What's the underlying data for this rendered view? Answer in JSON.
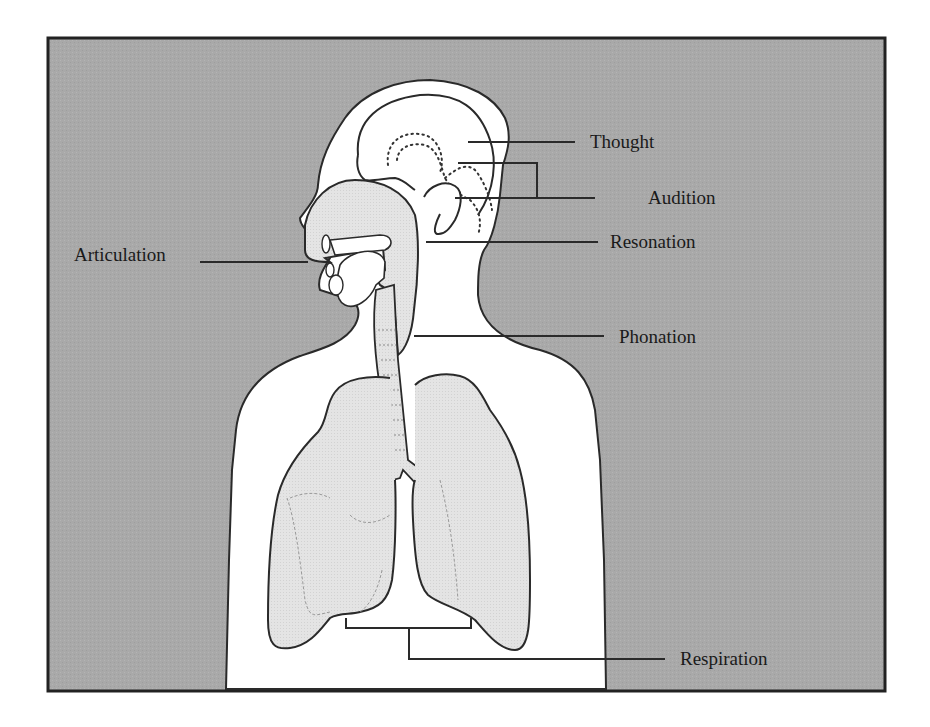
{
  "diagram": {
    "colors": {
      "background": "#a9a9a9",
      "frame": "#222222",
      "body_fill": "#ffffff",
      "organ_fill": "#e4e4e4",
      "outline": "#2a2a2a",
      "label_text": "#1a1a1a"
    },
    "labels": {
      "thought": "Thought",
      "audition": "Audition",
      "resonation": "Resonation",
      "articulation": "Articulation",
      "phonation": "Phonation",
      "respiration": "Respiration"
    },
    "parts": [
      {
        "name": "brain",
        "label_key": "thought"
      },
      {
        "name": "ear",
        "label_key": "audition"
      },
      {
        "name": "vocal-tract",
        "label_key": "resonation"
      },
      {
        "name": "mouth",
        "label_key": "articulation"
      },
      {
        "name": "larynx",
        "label_key": "phonation"
      },
      {
        "name": "lungs",
        "label_key": "respiration"
      }
    ]
  }
}
